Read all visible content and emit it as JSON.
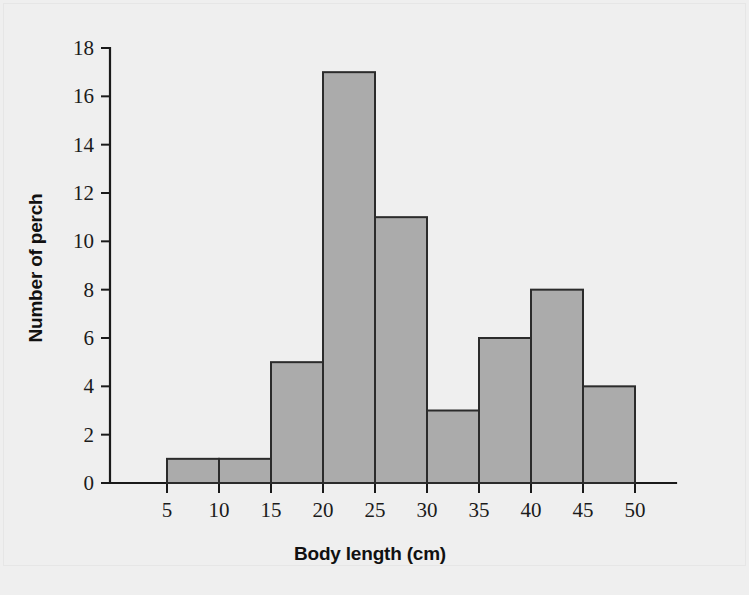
{
  "chart_data": {
    "type": "bar",
    "title": "",
    "subtitle": "",
    "xlabel": "Body length (cm)",
    "ylabel": "Number of perch",
    "categories": [
      "5-10",
      "10-15",
      "15-20",
      "20-25",
      "25-30",
      "30-35",
      "35-40",
      "40-45",
      "45-50"
    ],
    "bin_edges": [
      5,
      10,
      15,
      20,
      25,
      30,
      35,
      40,
      45,
      50
    ],
    "values": [
      1,
      1,
      5,
      17,
      11,
      3,
      6,
      8,
      4
    ],
    "bins": [
      {
        "start": 5,
        "end": 10,
        "count": 1
      },
      {
        "start": 10,
        "end": 15,
        "count": 1
      },
      {
        "start": 15,
        "end": 20,
        "count": 5
      },
      {
        "start": 20,
        "end": 25,
        "count": 17
      },
      {
        "start": 25,
        "end": 30,
        "count": 11
      },
      {
        "start": 30,
        "end": 35,
        "count": 3
      },
      {
        "start": 35,
        "end": 40,
        "count": 6
      },
      {
        "start": 40,
        "end": 45,
        "count": 8
      },
      {
        "start": 45,
        "end": 50,
        "count": 4
      }
    ],
    "xlim": [
      0,
      53
    ],
    "ylim": [
      0,
      18
    ],
    "xticks": [
      5,
      10,
      15,
      20,
      25,
      30,
      35,
      40,
      45,
      50
    ],
    "yticks": [
      0,
      2,
      4,
      6,
      8,
      10,
      12,
      14,
      16,
      18
    ],
    "xtick_labels": [
      "5",
      "10",
      "15",
      "20",
      "25",
      "30",
      "35",
      "40",
      "45",
      "50"
    ],
    "ytick_labels": [
      "0",
      "2",
      "4",
      "6",
      "8",
      "10",
      "12",
      "14",
      "16",
      "18"
    ],
    "grid": false,
    "legend": null,
    "total_count": 56,
    "colors": {
      "bar_fill": "#ababab",
      "bar_stroke": "#2b2b2b",
      "axis": "#1a1a1a",
      "background": "#efefef",
      "text": "#1b1b1b"
    }
  }
}
